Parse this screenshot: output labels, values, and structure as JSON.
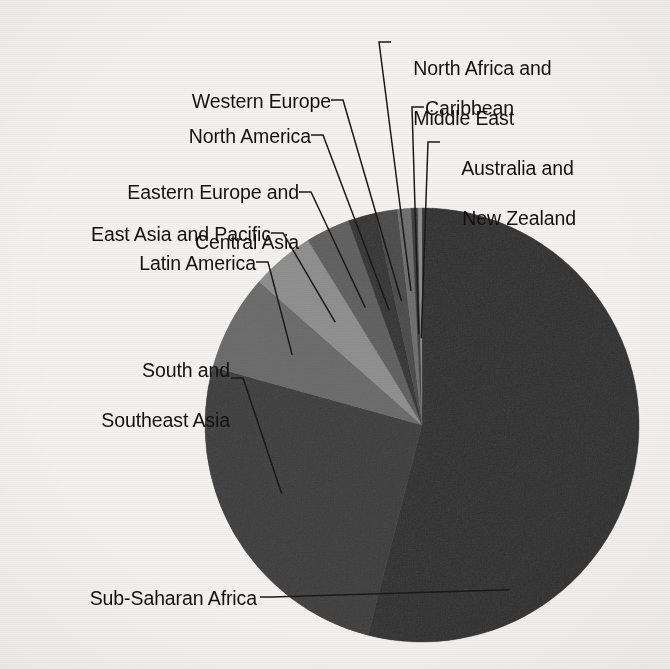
{
  "chart_data": {
    "type": "pie",
    "title": "",
    "subtitle": "",
    "xlabel": "",
    "ylabel": "",
    "legend_position": "none",
    "grid": false,
    "labels_placement": "outside-with-leader-lines",
    "start_angle_deg": 0,
    "direction": "clockwise",
    "categories": [
      "Sub-Saharan Africa",
      "South and Southeast Asia",
      "Latin America",
      "East Asia and Pacific",
      "Eastern Europe and Central Asia",
      "North America",
      "Western Europe",
      "North Africa and Middle East",
      "Caribbean",
      "Australia and New Zealand"
    ],
    "values": [
      54.0,
      25.3,
      7.2,
      4.7,
      3.3,
      2.1,
      1.6,
      1.0,
      0.5,
      0.3
    ],
    "series": [
      {
        "name": "Share",
        "values": [
          54.0,
          25.3,
          7.2,
          4.7,
          3.3,
          2.1,
          1.6,
          1.0,
          0.5,
          0.3
        ]
      }
    ],
    "slices": [
      {
        "label": "Sub-Saharan Africa",
        "value": 54.0,
        "start_deg": 0.0,
        "end_deg": 194.4,
        "color": "#2f2f2f"
      },
      {
        "label": "South and Southeast Asia",
        "value": 25.3,
        "start_deg": 194.4,
        "end_deg": 285.5,
        "color": "#3d3d3d"
      },
      {
        "label": "Latin America",
        "value": 7.2,
        "start_deg": 285.5,
        "end_deg": 311.4,
        "color": "#6a6a6a"
      },
      {
        "label": "East Asia and Pacific",
        "value": 4.7,
        "start_deg": 311.4,
        "end_deg": 328.3,
        "color": "#8e8e8e"
      },
      {
        "label": "Eastern Europe and Central Asia",
        "value": 3.3,
        "start_deg": 328.3,
        "end_deg": 340.2,
        "color": "#5f5f5f"
      },
      {
        "label": "North America",
        "value": 2.1,
        "start_deg": 340.2,
        "end_deg": 347.7,
        "color": "#333333"
      },
      {
        "label": "Western Europe",
        "value": 1.6,
        "start_deg": 347.7,
        "end_deg": 353.5,
        "color": "#4a4a4a"
      },
      {
        "label": "North Africa and Middle East",
        "value": 1.0,
        "start_deg": 353.5,
        "end_deg": 357.1,
        "color": "#6e6e6e"
      },
      {
        "label": "Caribbean",
        "value": 0.5,
        "start_deg": 357.1,
        "end_deg": 358.9,
        "color": "#3a3a3a"
      },
      {
        "label": "Australia and New Zealand",
        "value": 0.3,
        "start_deg": 358.9,
        "end_deg": 360.0,
        "color": "#8a8a8a"
      }
    ],
    "geometry": {
      "center_x": 422,
      "center_y": 425,
      "radius": 217
    },
    "colors": {
      "background": "#f3f2f0",
      "text": "#121212",
      "leader_line": "#1a1a1a"
    }
  },
  "labels": {
    "sub_saharan_africa": "Sub-Saharan Africa",
    "south_and_southeast_asia_line1": "South and",
    "south_and_southeast_asia_line2": "Southeast Asia",
    "latin_america": "Latin America",
    "east_asia_and_pacific": "East Asia and Pacific",
    "eastern_europe_line1": "Eastern Europe and",
    "eastern_europe_line2": "Central Asia",
    "north_america": "North America",
    "western_europe": "Western Europe",
    "north_africa_line1": "North Africa and",
    "north_africa_line2": "Middle East",
    "caribbean": "Caribbean",
    "australia_line1": "Australia and",
    "australia_line2": "New Zealand"
  }
}
